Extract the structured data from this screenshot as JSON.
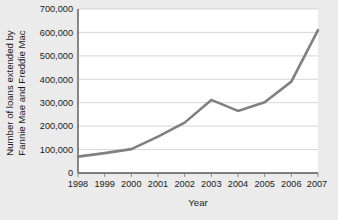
{
  "chart_data": {
    "type": "line",
    "title": "",
    "xlabel": "Year",
    "ylabel": "Number of loans extended by Fannie Mae and Freddie Mac",
    "ylabel_line1": "Number of loans extended by",
    "ylabel_line2": "Fannie Mae and Freddie Mac",
    "categories": [
      "1998",
      "1999",
      "2000",
      "2001",
      "2002",
      "2003",
      "2004",
      "2005",
      "2006",
      "2007"
    ],
    "x": [
      1998,
      1999,
      2000,
      2001,
      2002,
      2003,
      2004,
      2005,
      2006,
      2007
    ],
    "values": [
      70000,
      85000,
      102000,
      155000,
      215000,
      312000,
      265000,
      302000,
      390000,
      610000
    ],
    "ytick_labels": [
      "0",
      "100,000",
      "200,000",
      "300,000",
      "400,000",
      "500,000",
      "600,000",
      "700,000"
    ],
    "ytick_values": [
      0,
      100000,
      200000,
      300000,
      400000,
      500000,
      600000,
      700000
    ],
    "xtick_labels": [
      "1998",
      "1999",
      "2000",
      "2001",
      "2002",
      "2003",
      "2004",
      "2005",
      "2006",
      "2007"
    ],
    "ylim": [
      0,
      700000
    ],
    "xlim": [
      1998,
      2007
    ],
    "grid": "horizontal",
    "legend": "none",
    "series_color": "#808080",
    "gridline_color": "#cccccc",
    "axis_color": "#595959",
    "plot_background": "#ffffff",
    "figure_background": "#ebebeb"
  }
}
